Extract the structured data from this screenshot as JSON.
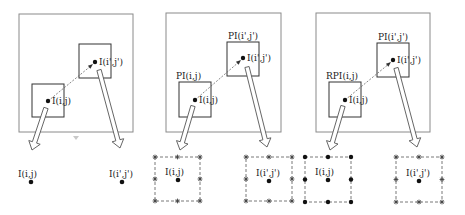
{
  "colors": {
    "frame": "#8a8a8a",
    "box": "#333333",
    "dot": "#111111",
    "arrow_fill": "#ffffff",
    "arrow_stroke": "#555555",
    "grid_dash": "#555555",
    "artifact": "#c8c8c8"
  },
  "panels": [
    {
      "id": "panel-1",
      "frame": {
        "x": 19,
        "y": 14,
        "w": 114,
        "h": 118
      },
      "box1": {
        "x": 32,
        "y": 84,
        "w": 32,
        "h": 33,
        "title": ""
      },
      "box2": {
        "x": 79,
        "y": 44,
        "w": 32,
        "h": 34,
        "title": ""
      },
      "dot1": {
        "x": 48,
        "y": 101,
        "label": "I(i,j)"
      },
      "dot2": {
        "x": 95,
        "y": 62,
        "label": "I(i',j')"
      },
      "bottom_left": {
        "type": "point",
        "cx": 31,
        "cy": 182,
        "label": "I(i,j)"
      },
      "bottom_right": {
        "type": "point",
        "cx": 122,
        "cy": 182,
        "label": "I(i',j')"
      }
    },
    {
      "id": "panel-2",
      "frame": {
        "x": 166,
        "y": 13,
        "w": 115,
        "h": 119
      },
      "box1": {
        "x": 179,
        "y": 82,
        "w": 32,
        "h": 35,
        "title": "PI(i,j)"
      },
      "box2": {
        "x": 227,
        "y": 42,
        "w": 32,
        "h": 34,
        "title": "PI(i',j')"
      },
      "dot1": {
        "x": 195,
        "y": 100,
        "label": "I(i,j)"
      },
      "dot2": {
        "x": 243,
        "y": 58,
        "label": "I(i',j')"
      },
      "bottom_left": {
        "type": "grid",
        "x": 155,
        "y": 157,
        "w": 45,
        "h": 44,
        "cx": 178,
        "cy": 180,
        "marker": "asterisk",
        "label": "I(i,j)"
      },
      "bottom_right": {
        "type": "grid",
        "x": 246,
        "y": 157,
        "w": 46,
        "h": 44,
        "cx": 269,
        "cy": 181,
        "marker": "asterisk",
        "label": "I(i',j')"
      }
    },
    {
      "id": "panel-3",
      "frame": {
        "x": 316,
        "y": 13,
        "w": 114,
        "h": 119
      },
      "box1": {
        "x": 329,
        "y": 82,
        "w": 32,
        "h": 35,
        "title": "RPI(i,j)"
      },
      "box2": {
        "x": 377,
        "y": 43,
        "w": 32,
        "h": 34,
        "title": "PI(i',j')"
      },
      "dot1": {
        "x": 345,
        "y": 100,
        "label": "I(i,j)"
      },
      "dot2": {
        "x": 393,
        "y": 60,
        "label": "I(i',j')"
      },
      "bottom_left": {
        "type": "grid",
        "x": 305,
        "y": 157,
        "w": 46,
        "h": 45,
        "cx": 328,
        "cy": 180,
        "marker": "dot",
        "label": "I(i,j)"
      },
      "bottom_right": {
        "type": "grid",
        "x": 396,
        "y": 157,
        "w": 46,
        "h": 45,
        "cx": 419,
        "cy": 181,
        "marker": "asterisk",
        "label": "I(i',j')"
      }
    }
  ],
  "arrows": [
    {
      "x1": 46,
      "y1": 108,
      "x2": 32,
      "y2": 150
    },
    {
      "x1": 99,
      "y1": 70,
      "x2": 120,
      "y2": 148
    },
    {
      "x1": 193,
      "y1": 106,
      "x2": 180,
      "y2": 150
    },
    {
      "x1": 247,
      "y1": 67,
      "x2": 267,
      "y2": 147
    },
    {
      "x1": 343,
      "y1": 106,
      "x2": 330,
      "y2": 150
    },
    {
      "x1": 396,
      "y1": 68,
      "x2": 417,
      "y2": 147
    }
  ],
  "artifact": {
    "x": 76,
    "y": 138
  }
}
